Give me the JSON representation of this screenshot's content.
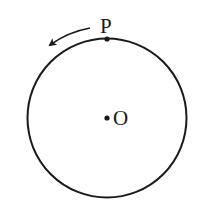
{
  "diagram": {
    "type": "circle-with-moving-point",
    "circle": {
      "cx": 107,
      "cy": 118,
      "r": 79.5,
      "stroke": "#1a1a1a"
    },
    "center_point": {
      "label": "O",
      "x": 107,
      "y": 118
    },
    "moving_point": {
      "label": "P",
      "x": 107,
      "y": 39
    },
    "arrow": {
      "direction": "counterclockwise",
      "icon": "curved-arrow-left-icon"
    }
  }
}
